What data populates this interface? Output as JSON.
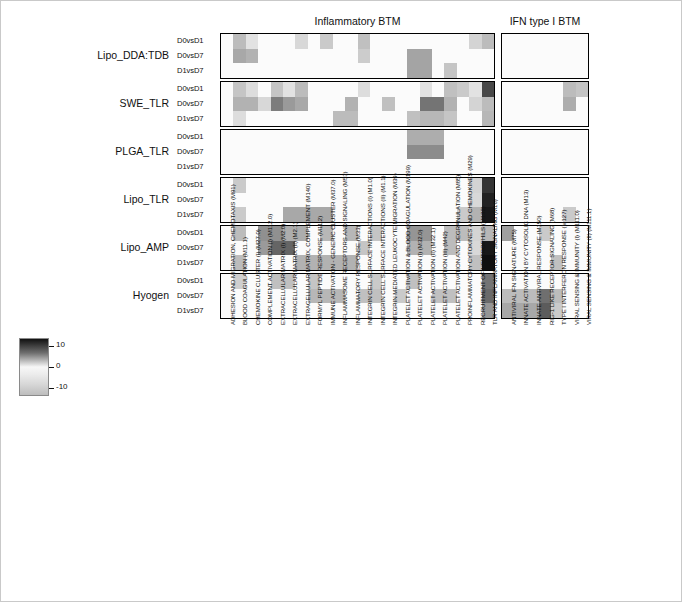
{
  "figure": {
    "panels": [
      {
        "id": "inflammatory",
        "title": "Inflammatory BTM"
      },
      {
        "id": "ifn",
        "title": "IFN type I BTM"
      }
    ]
  },
  "row_groups": [
    "Lipo_DDA:TDB",
    "SWE_TLR",
    "PLGA_TLR",
    "Lipo_TLR",
    "Lipo_AMP",
    "Hyogen"
  ],
  "comparisons": [
    "D0vsD1",
    "D0vsD7",
    "D1vsD7"
  ],
  "colorbar": {
    "ticks": [
      "10",
      "0",
      "-10"
    ],
    "vmin": -10,
    "vmax": 10,
    "colormap": "grayscale-diverging"
  },
  "chart_data": {
    "type": "heatmap",
    "title": "",
    "xlabel": "",
    "ylabel": "",
    "zlim": [
      -10,
      10
    ],
    "grid": false,
    "legend_position": "bottom-left",
    "row_groups": [
      "Lipo_DDA:TDB",
      "SWE_TLR",
      "PLGA_TLR",
      "Lipo_TLR",
      "Lipo_AMP",
      "Hyogen"
    ],
    "row_subcategories": [
      "D0vsD1",
      "D0vsD7",
      "D1vsD7"
    ],
    "y": [
      "Lipo_DDA:TDB D0vsD1",
      "Lipo_DDA:TDB D0vsD7",
      "Lipo_DDA:TDB D1vsD7",
      "SWE_TLR D0vsD1",
      "SWE_TLR D0vsD7",
      "SWE_TLR D1vsD7",
      "PLGA_TLR D0vsD1",
      "PLGA_TLR D0vsD7",
      "PLGA_TLR D1vsD7",
      "Lipo_TLR D0vsD1",
      "Lipo_TLR D0vsD7",
      "Lipo_TLR D1vsD7",
      "Lipo_AMP D0vsD1",
      "Lipo_AMP D0vsD7",
      "Lipo_AMP D1vsD7",
      "Hyogen D0vsD1",
      "Hyogen D0vsD7",
      "Hyogen D1vsD7"
    ],
    "panels": [
      {
        "name": "Inflammatory BTM",
        "columns": [
          "ADHESION AND MIGRATION, CHEMOTAXIS (M91)",
          "BLOOD COAGULATION (M11.1)",
          "CHEMOKINE CLUSTER (I) (M27.0)",
          "COMPLEMENT ACTIVATION (I) (M112.0)",
          "EXTRACELLULAR MATRIX (I) (M2.0)",
          "EXTRACELLULAR MATRIX (II) (M2.1)",
          "EXTRACELLULAR MATRIX, COMPLEMENT (M140)",
          "FORMYL PEPTIDE RESPONSE (M11.2)",
          "IMMUNE ACTIVATION - GENERIC CLUSTER (M37.0)",
          "INFLAMMASOME RECEPTORS AND SIGNALING (M53)",
          "INFLAMMATORY RESPONSE (M33)",
          "INTEGRIN CELL SURFACE INTERACTIONS (I) (M1.0)",
          "INTEGRIN CELL SURFACE INTERACTIONS (II) (M1.1)",
          "INTEGRIN MEDIATED LEUKOCYTE MIGRATION (M39)",
          "PLATELET ACTIVATION & BLOOD COAGULATION (M199)",
          "PLATELET ACTIVATION (I) (M32.0)",
          "PLATELET ACTIVATION (II) (M32.1)",
          "PLATELET ACTIVATION (III) (M42)",
          "PLATELET ACTIVATION AND DEGRANULATION (M85)",
          "PROINFLAMMATORY CYTOKINES AND CHEMOKINES (M29)",
          "RECRUITMENT OF NEUTROPHILS (M132)",
          "TLR AND INFLAMMATORY SIGNALING (M16)"
        ],
        "values": [
          [
            0.0,
            2.6,
            1.0,
            0.0,
            0.0,
            0.0,
            1.4,
            0.0,
            2.0,
            0.0,
            0.0,
            2.4,
            0.0,
            0.0,
            0.0,
            0.0,
            0.0,
            0.0,
            0.0,
            0.0,
            1.6,
            2.6
          ],
          [
            0.0,
            3.4,
            3.0,
            0.0,
            0.0,
            0.0,
            0.0,
            0.0,
            0.0,
            0.0,
            0.0,
            1.9,
            0.0,
            0.0,
            0.0,
            3.6,
            3.6,
            0.0,
            0.0,
            0.0,
            0.0,
            0.0
          ],
          [
            0.0,
            0.0,
            0.0,
            0.0,
            0.0,
            0.0,
            0.0,
            0.0,
            0.0,
            0.0,
            0.0,
            0.0,
            0.0,
            0.0,
            0.0,
            3.6,
            3.6,
            0.0,
            2.2,
            0.0,
            0.0,
            0.0
          ],
          [
            0.0,
            2.2,
            1.2,
            0.0,
            2.2,
            1.0,
            2.6,
            0.0,
            0.0,
            0.0,
            0.0,
            1.2,
            0.0,
            0.0,
            0.0,
            0.0,
            1.0,
            0.0,
            2.4,
            2.0,
            1.0,
            7.4
          ],
          [
            0.0,
            3.0,
            3.0,
            1.4,
            5.2,
            4.0,
            3.4,
            0.0,
            0.0,
            0.0,
            3.0,
            0.0,
            0.0,
            2.4,
            0.0,
            0.0,
            5.6,
            5.6,
            3.0,
            0.0,
            1.6,
            2.6
          ],
          [
            0.0,
            1.2,
            0.0,
            0.0,
            0.0,
            0.0,
            0.0,
            0.0,
            0.0,
            2.6,
            2.6,
            0.0,
            0.0,
            0.0,
            0.0,
            2.4,
            2.8,
            2.8,
            2.2,
            0.0,
            0.0,
            2.8
          ],
          [
            0.0,
            0.0,
            0.0,
            0.0,
            0.0,
            0.0,
            0.0,
            0.0,
            0.0,
            0.0,
            0.0,
            0.0,
            0.0,
            0.0,
            0.0,
            3.2,
            3.2,
            3.2,
            0.0,
            0.0,
            0.0,
            0.0
          ],
          [
            0.0,
            0.0,
            0.0,
            0.0,
            0.0,
            0.0,
            0.0,
            0.0,
            0.0,
            0.0,
            0.0,
            0.0,
            0.0,
            0.0,
            0.0,
            4.6,
            4.6,
            4.6,
            0.0,
            0.0,
            0.0,
            0.0
          ],
          [
            0.0,
            0.0,
            0.0,
            0.0,
            0.0,
            0.0,
            0.0,
            0.0,
            0.0,
            0.0,
            0.0,
            0.0,
            0.0,
            0.0,
            0.0,
            0.0,
            0.0,
            0.0,
            0.0,
            0.0,
            0.0,
            0.0
          ],
          [
            0.0,
            2.0,
            0.0,
            0.0,
            0.0,
            0.0,
            0.0,
            0.0,
            0.0,
            0.0,
            0.0,
            0.0,
            0.0,
            0.0,
            0.0,
            0.0,
            0.0,
            0.0,
            0.0,
            0.0,
            1.6,
            8.2
          ],
          [
            0.0,
            0.0,
            0.0,
            0.0,
            0.0,
            0.0,
            0.0,
            0.0,
            0.0,
            0.0,
            0.0,
            0.0,
            0.0,
            0.0,
            0.0,
            0.0,
            0.0,
            0.0,
            0.0,
            0.0,
            1.4,
            9.0
          ],
          [
            0.0,
            2.0,
            0.0,
            0.0,
            0.0,
            3.4,
            3.4,
            3.4,
            3.4,
            0.0,
            0.0,
            0.0,
            0.0,
            0.0,
            0.0,
            0.0,
            0.0,
            0.0,
            0.0,
            2.0,
            3.0,
            9.4
          ],
          [
            0.0,
            2.6,
            0.0,
            4.4,
            4.4,
            3.2,
            3.2,
            0.0,
            2.8,
            0.0,
            2.8,
            0.0,
            2.2,
            0.0,
            0.0,
            4.2,
            4.2,
            0.0,
            2.6,
            2.6,
            1.6,
            2.8
          ],
          [
            0.0,
            0.0,
            0.0,
            4.0,
            6.2,
            6.2,
            0.0,
            0.0,
            0.0,
            0.0,
            0.0,
            2.2,
            0.0,
            0.0,
            0.0,
            3.0,
            3.0,
            0.0,
            2.6,
            0.0,
            1.4,
            9.4
          ],
          [
            0.0,
            2.6,
            0.0,
            0.0,
            0.0,
            0.0,
            3.0,
            3.0,
            3.0,
            3.0,
            3.0,
            0.0,
            0.0,
            0.0,
            0.0,
            0.0,
            0.0,
            0.0,
            0.0,
            0.0,
            2.4,
            9.8
          ],
          [
            0.0,
            1.8,
            0.0,
            0.0,
            2.4,
            2.4,
            0.0,
            2.2,
            0.0,
            0.0,
            0.0,
            0.0,
            2.0,
            0.0,
            0.0,
            2.4,
            0.0,
            0.0,
            0.0,
            0.0,
            0.0,
            5.6
          ],
          [
            0.0,
            0.0,
            0.0,
            0.0,
            0.0,
            0.0,
            0.0,
            2.8,
            2.8,
            2.8,
            0.0,
            2.4,
            2.4,
            0.0,
            2.0,
            0.0,
            0.0,
            2.4,
            2.4,
            0.0,
            0.0,
            6.0
          ],
          [
            0.0,
            0.0,
            0.0,
            0.0,
            0.0,
            0.0,
            0.0,
            0.0,
            0.0,
            0.0,
            0.0,
            0.0,
            0.0,
            0.0,
            0.0,
            0.0,
            0.0,
            0.0,
            0.0,
            0.0,
            0.0,
            4.2
          ]
        ]
      },
      {
        "name": "IFN type I BTM",
        "columns": [
          "ANTIVIRAL IFN SIGNATURE (M75)",
          "INNATE ACTIVATION BY CYTOSOLIC DNA (M13)",
          "INNATE ANTIVIRAL RESPONSE (M150)",
          "RIG-1 LIKE RECEPTOR SIGNALING (M68)",
          "TYPE I INTERFERON RESPONSE (M127)",
          "VIRAL SENSING & IMMUNITY (I) (M111.0)",
          "VIRAL SENSING & IMMUNITY (II) (M111.1)"
        ],
        "values": [
          [
            0.0,
            0.0,
            0.0,
            0.0,
            0.0,
            0.0,
            0.0
          ],
          [
            0.0,
            0.0,
            0.0,
            0.0,
            0.0,
            0.0,
            0.0
          ],
          [
            0.0,
            0.0,
            0.0,
            0.0,
            0.0,
            0.0,
            0.0
          ],
          [
            0.0,
            0.0,
            0.0,
            0.0,
            0.0,
            2.6,
            2.2
          ],
          [
            0.0,
            0.0,
            0.0,
            0.0,
            0.0,
            3.2,
            0.0
          ],
          [
            0.0,
            0.0,
            0.0,
            0.0,
            0.0,
            0.0,
            0.0
          ],
          [
            0.0,
            0.0,
            0.0,
            0.0,
            0.0,
            0.0,
            0.0
          ],
          [
            0.0,
            0.0,
            0.0,
            0.0,
            0.0,
            0.0,
            0.0
          ],
          [
            0.0,
            0.0,
            0.0,
            0.0,
            0.0,
            0.0,
            0.0
          ],
          [
            0.0,
            0.0,
            0.0,
            0.0,
            0.0,
            0.0,
            0.0
          ],
          [
            0.0,
            0.0,
            0.0,
            0.0,
            0.0,
            0.0,
            0.0
          ],
          [
            0.0,
            0.0,
            0.0,
            0.0,
            0.0,
            2.0,
            0.0
          ],
          [
            3.8,
            0.0,
            0.0,
            2.0,
            0.0,
            0.0,
            0.0
          ],
          [
            0.0,
            0.0,
            0.0,
            0.0,
            0.0,
            0.0,
            0.0
          ],
          [
            0.0,
            0.0,
            0.0,
            0.0,
            2.4,
            0.0,
            0.0
          ],
          [
            0.0,
            0.0,
            0.0,
            0.0,
            0.0,
            0.0,
            0.0
          ],
          [
            2.6,
            2.6,
            2.6,
            5.8,
            2.6,
            0.0,
            0.0
          ],
          [
            3.4,
            3.4,
            3.4,
            6.6,
            2.0,
            0.0,
            0.0
          ]
        ]
      }
    ]
  }
}
